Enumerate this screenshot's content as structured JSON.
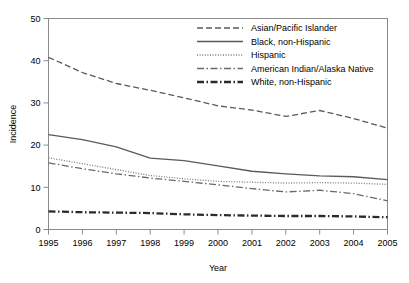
{
  "chart_data": {
    "type": "line",
    "title": "",
    "subtitle": "",
    "xlabel": "Year",
    "ylabel": "Incidence",
    "xlim": [
      1995,
      2005
    ],
    "ylim": [
      0,
      50
    ],
    "xticks": [
      1995,
      1996,
      1997,
      1998,
      1999,
      2000,
      2001,
      2002,
      2003,
      2004,
      2005
    ],
    "yticks": [
      0,
      10,
      20,
      30,
      40,
      50
    ],
    "xtick_labels": [
      "1995",
      "1996",
      "1997",
      "1998",
      "1999",
      "2000",
      "2001",
      "2002",
      "2003",
      "2004",
      "2005"
    ],
    "ytick_labels": [
      "0",
      "10",
      "20",
      "30",
      "40",
      "50"
    ],
    "grid": false,
    "legend_position": "top-right-inside",
    "x": [
      1995,
      1996,
      1997,
      1998,
      1999,
      2000,
      2001,
      2002,
      2003,
      2004,
      2005
    ],
    "series": [
      {
        "name": "Asian/Pacific Islander",
        "style": "dashed",
        "color": "#5a5a5a",
        "width": 1.3,
        "dasharray": "6,3",
        "values": [
          40.8,
          37.2,
          34.6,
          33.0,
          31.2,
          29.3,
          28.3,
          26.8,
          28.2,
          26.3,
          24.0
        ]
      },
      {
        "name": "Black, non-Hispanic",
        "style": "solid",
        "color": "#5a5a5a",
        "width": 1.3,
        "dasharray": "",
        "values": [
          22.5,
          21.3,
          19.6,
          16.9,
          16.3,
          15.1,
          13.8,
          13.2,
          12.7,
          12.5,
          11.8
        ]
      },
      {
        "name": "Hispanic",
        "style": "dotted",
        "color": "#7a7a7a",
        "width": 1.3,
        "dasharray": "1,1.6",
        "values": [
          17.0,
          15.6,
          14.2,
          12.8,
          12.0,
          11.4,
          11.2,
          11.0,
          11.1,
          11.0,
          10.7
        ]
      },
      {
        "name": "American Indian/Alaska Native",
        "style": "dash-dot",
        "color": "#6a6a6a",
        "width": 1.3,
        "dasharray": "7,2.5,1.5,2.5",
        "values": [
          15.8,
          14.4,
          13.2,
          12.2,
          11.4,
          10.6,
          9.7,
          8.9,
          9.3,
          8.5,
          6.8
        ]
      },
      {
        "name": "White, non-Hispanic",
        "style": "bold-dash-dot",
        "color": "#2b2b2b",
        "width": 2.3,
        "dasharray": "7,2.5,1.5,2.5",
        "values": [
          4.3,
          4.1,
          4.0,
          3.9,
          3.6,
          3.4,
          3.3,
          3.2,
          3.2,
          3.1,
          2.9
        ]
      }
    ]
  },
  "axes": {
    "y_title": "Incidence",
    "x_title": "Year"
  },
  "legend": {
    "entries": [
      {
        "label": "Asian/Pacific Islander"
      },
      {
        "label": "Black, non-Hispanic"
      },
      {
        "label": "Hispanic"
      },
      {
        "label": "American Indian/Alaska Native"
      },
      {
        "label": "White, non-Hispanic"
      }
    ]
  }
}
